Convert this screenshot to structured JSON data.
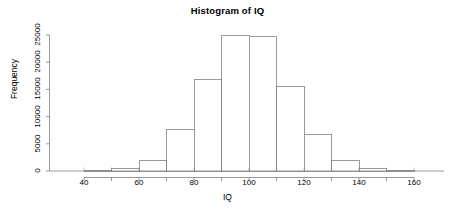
{
  "chart_data": {
    "type": "bar",
    "title": "Histogram of IQ",
    "xlabel": "IQ",
    "ylabel": "Frequency",
    "bin_width": 10,
    "bin_edges": [
      40,
      50,
      60,
      70,
      80,
      90,
      100,
      110,
      120,
      130,
      140,
      150,
      160
    ],
    "categories": [
      "40-50",
      "50-60",
      "60-70",
      "70-80",
      "80-90",
      "90-100",
      "100-110",
      "110-120",
      "120-130",
      "130-140",
      "140-150",
      "150-160"
    ],
    "values": [
      60,
      400,
      2020,
      7540,
      16900,
      25000,
      24750,
      15500,
      6800,
      1840,
      400,
      60
    ],
    "xlim": [
      36,
      164
    ],
    "ylim": [
      0,
      26000
    ],
    "xticks": [
      40,
      60,
      80,
      100,
      120,
      140,
      160
    ],
    "xtick_labels": [
      "40",
      "60",
      "80",
      "100",
      "120",
      "140",
      "160"
    ],
    "xminor_ticks": [
      50,
      70,
      90,
      110,
      130,
      150
    ],
    "yticks": [
      0,
      5000,
      10000,
      15000,
      20000,
      25000
    ],
    "ytick_labels": [
      "0",
      "5000",
      "10000",
      "15000",
      "20000",
      "25000"
    ],
    "grid": false,
    "legend": false,
    "bar_fill": "#ffffff",
    "bar_stroke": "#808080",
    "axis_color": "#808080",
    "text_color": "#000000"
  },
  "chart": {
    "title": "Histogram of IQ",
    "x_axis_title": "IQ",
    "y_axis_title": "Frequency"
  }
}
